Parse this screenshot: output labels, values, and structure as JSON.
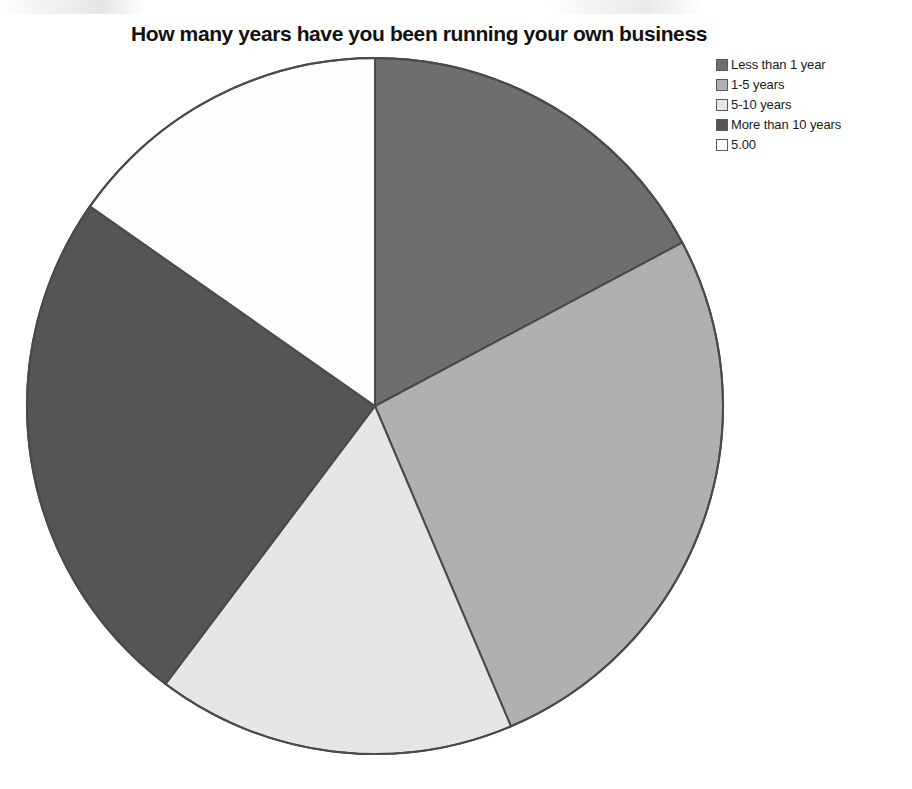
{
  "chart_data": {
    "type": "pie",
    "title": "How many years have you been running your own business",
    "xlabel": "",
    "ylabel": "",
    "legend_position": "top-right",
    "grid": false,
    "categories": [
      "Less than 1 year",
      "1-5 years",
      "5-10 years",
      "More than 10 years",
      "5.00"
    ],
    "values": [
      21.5,
      26.5,
      16.7,
      24.4,
      15.3
    ],
    "value_unit": "percent",
    "start_angle_deg": 0,
    "direction": "clockwise",
    "slice_boundaries_deg": [
      0,
      62,
      157,
      217,
      305,
      360
    ],
    "colors": [
      "#6e6e6e",
      "#b0b0b0",
      "#e6e6e6",
      "#555555",
      "#fdfdfd"
    ],
    "slice_border_color": "#4a4a4a",
    "slices": [
      {
        "label": "Less than 1 year",
        "value": 21.5,
        "color": "#6e6e6e",
        "start_deg": 0,
        "end_deg": 62
      },
      {
        "label": "1-5 years",
        "value": 26.5,
        "color": "#b0b0b0",
        "start_deg": 62,
        "end_deg": 157
      },
      {
        "label": "5-10 years",
        "value": 16.7,
        "color": "#e6e6e6",
        "start_deg": 157,
        "end_deg": 217
      },
      {
        "label": "More than 10 years",
        "value": 24.4,
        "color": "#555555",
        "start_deg": 217,
        "end_deg": 305
      },
      {
        "label": "5.00",
        "value": 15.3,
        "color": "#fdfdfd",
        "start_deg": 305,
        "end_deg": 360
      }
    ],
    "geometry": {
      "center_x": 375,
      "center_y": 406,
      "radius": 348
    }
  },
  "legend": {
    "items": [
      {
        "label": "Less than 1 year",
        "color": "#6e6e6e"
      },
      {
        "label": "1-5 years",
        "color": "#b0b0b0"
      },
      {
        "label": "5-10 years",
        "color": "#e6e6e6"
      },
      {
        "label": "More than 10 years",
        "color": "#555555"
      },
      {
        "label": "5.00",
        "color": "#fdfdfd"
      }
    ]
  }
}
